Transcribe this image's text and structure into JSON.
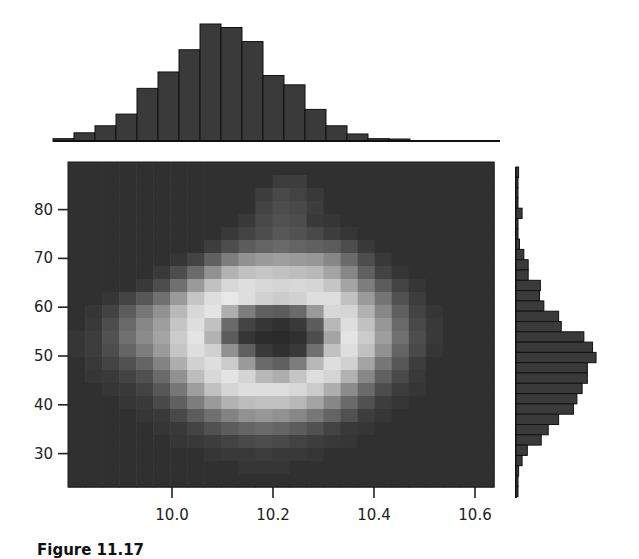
{
  "chart_data": {
    "type": "heatmap",
    "title": "",
    "caption": "Figure 11.17",
    "colormap": "grayscale (dark = low, light = high)",
    "colors": {
      "background": "#ffffff",
      "bar_fill": "#3a3a3a",
      "bar_edge": "#111111",
      "axis": "#222222"
    },
    "main": {
      "type": "heatmap",
      "xlabel": "",
      "ylabel": "",
      "xlim": [
        9.79,
        10.64
      ],
      "ylim": [
        23.5,
        90
      ],
      "xticks": [
        10.0,
        10.2,
        10.4,
        10.6
      ],
      "xtick_labels": [
        "10.0",
        "10.2",
        "10.4",
        "10.6"
      ],
      "yticks": [
        30,
        40,
        50,
        60,
        70,
        80
      ],
      "ytick_labels": [
        "30",
        "40",
        "50",
        "60",
        "70",
        "80"
      ],
      "grid": false,
      "rows": 25,
      "cols": 25,
      "description": "2D density showing a ring (annulus) of high density centered near x=10.2, y=51 with a dark low-density hole in the middle",
      "values_top_to_bottom": [
        [
          0.05,
          0.05,
          0.05,
          0.05,
          0.05,
          0.05,
          0.05,
          0.05,
          0.05,
          0.05,
          0.05,
          0.05,
          0.05,
          0.05,
          0.05,
          0.05,
          0.05,
          0.05,
          0.05,
          0.05,
          0.05,
          0.05,
          0.05,
          0.05,
          0.05
        ],
        [
          0.05,
          0.05,
          0.05,
          0.05,
          0.05,
          0.05,
          0.05,
          0.05,
          0.05,
          0.05,
          0.05,
          0.05,
          0.12,
          0.12,
          0.05,
          0.05,
          0.05,
          0.05,
          0.05,
          0.05,
          0.05,
          0.05,
          0.05,
          0.05,
          0.05
        ],
        [
          0.05,
          0.05,
          0.05,
          0.05,
          0.05,
          0.05,
          0.05,
          0.05,
          0.05,
          0.05,
          0.05,
          0.12,
          0.18,
          0.15,
          0.1,
          0.05,
          0.05,
          0.05,
          0.05,
          0.05,
          0.05,
          0.05,
          0.05,
          0.05,
          0.05
        ],
        [
          0.05,
          0.05,
          0.05,
          0.05,
          0.05,
          0.05,
          0.05,
          0.05,
          0.05,
          0.05,
          0.05,
          0.15,
          0.2,
          0.18,
          0.12,
          0.05,
          0.05,
          0.05,
          0.05,
          0.05,
          0.05,
          0.05,
          0.05,
          0.05,
          0.05
        ],
        [
          0.05,
          0.05,
          0.05,
          0.05,
          0.05,
          0.05,
          0.05,
          0.05,
          0.05,
          0.05,
          0.1,
          0.18,
          0.22,
          0.2,
          0.1,
          0.08,
          0.05,
          0.05,
          0.05,
          0.05,
          0.05,
          0.05,
          0.05,
          0.05,
          0.05
        ],
        [
          0.05,
          0.05,
          0.05,
          0.05,
          0.05,
          0.05,
          0.05,
          0.05,
          0.05,
          0.1,
          0.15,
          0.2,
          0.25,
          0.22,
          0.18,
          0.12,
          0.08,
          0.05,
          0.05,
          0.05,
          0.05,
          0.05,
          0.05,
          0.05,
          0.05
        ],
        [
          0.05,
          0.05,
          0.05,
          0.05,
          0.05,
          0.05,
          0.05,
          0.05,
          0.12,
          0.2,
          0.28,
          0.32,
          0.35,
          0.32,
          0.3,
          0.28,
          0.2,
          0.1,
          0.05,
          0.05,
          0.05,
          0.05,
          0.05,
          0.05,
          0.05
        ],
        [
          0.05,
          0.05,
          0.05,
          0.05,
          0.05,
          0.05,
          0.08,
          0.15,
          0.3,
          0.45,
          0.55,
          0.6,
          0.62,
          0.6,
          0.58,
          0.5,
          0.35,
          0.2,
          0.1,
          0.05,
          0.05,
          0.05,
          0.05,
          0.05,
          0.05
        ],
        [
          0.05,
          0.05,
          0.05,
          0.05,
          0.05,
          0.1,
          0.2,
          0.35,
          0.55,
          0.72,
          0.8,
          0.82,
          0.8,
          0.78,
          0.75,
          0.65,
          0.5,
          0.3,
          0.15,
          0.08,
          0.05,
          0.05,
          0.05,
          0.05,
          0.05
        ],
        [
          0.05,
          0.05,
          0.05,
          0.05,
          0.1,
          0.2,
          0.38,
          0.6,
          0.8,
          0.92,
          0.95,
          0.92,
          0.9,
          0.92,
          0.9,
          0.82,
          0.65,
          0.45,
          0.28,
          0.15,
          0.08,
          0.05,
          0.05,
          0.05,
          0.05
        ],
        [
          0.05,
          0.05,
          0.08,
          0.15,
          0.25,
          0.38,
          0.6,
          0.82,
          0.95,
          1.0,
          0.95,
          0.88,
          0.85,
          0.88,
          0.95,
          0.95,
          0.8,
          0.6,
          0.4,
          0.22,
          0.12,
          0.05,
          0.05,
          0.05,
          0.05
        ],
        [
          0.05,
          0.08,
          0.15,
          0.28,
          0.42,
          0.55,
          0.75,
          0.92,
          0.98,
          0.7,
          0.45,
          0.3,
          0.28,
          0.35,
          0.6,
          0.92,
          0.9,
          0.72,
          0.5,
          0.3,
          0.15,
          0.08,
          0.05,
          0.05,
          0.05
        ],
        [
          0.05,
          0.1,
          0.2,
          0.35,
          0.5,
          0.62,
          0.82,
          0.95,
          0.8,
          0.35,
          0.15,
          0.08,
          0.05,
          0.1,
          0.28,
          0.75,
          0.95,
          0.8,
          0.58,
          0.35,
          0.18,
          0.1,
          0.05,
          0.05,
          0.05
        ],
        [
          0.08,
          0.12,
          0.22,
          0.38,
          0.52,
          0.65,
          0.85,
          0.98,
          0.72,
          0.28,
          0.08,
          0.03,
          0.02,
          0.05,
          0.2,
          0.65,
          0.98,
          0.85,
          0.62,
          0.38,
          0.2,
          0.1,
          0.05,
          0.05,
          0.05
        ],
        [
          0.08,
          0.12,
          0.2,
          0.32,
          0.45,
          0.6,
          0.82,
          0.95,
          0.88,
          0.55,
          0.3,
          0.1,
          0.05,
          0.1,
          0.38,
          0.8,
          0.95,
          0.8,
          0.55,
          0.32,
          0.18,
          0.08,
          0.05,
          0.05,
          0.05
        ],
        [
          0.05,
          0.1,
          0.15,
          0.22,
          0.32,
          0.48,
          0.7,
          0.88,
          0.95,
          0.85,
          0.6,
          0.35,
          0.3,
          0.45,
          0.75,
          0.95,
          0.88,
          0.65,
          0.42,
          0.25,
          0.12,
          0.05,
          0.05,
          0.05,
          0.05
        ],
        [
          0.05,
          0.08,
          0.1,
          0.15,
          0.22,
          0.35,
          0.55,
          0.78,
          0.92,
          0.98,
          0.9,
          0.75,
          0.7,
          0.82,
          0.95,
          0.9,
          0.72,
          0.5,
          0.3,
          0.18,
          0.1,
          0.05,
          0.05,
          0.05,
          0.05
        ],
        [
          0.05,
          0.05,
          0.08,
          0.1,
          0.15,
          0.25,
          0.42,
          0.62,
          0.8,
          0.9,
          0.95,
          0.95,
          0.95,
          0.92,
          0.85,
          0.7,
          0.52,
          0.35,
          0.2,
          0.12,
          0.08,
          0.05,
          0.05,
          0.05,
          0.05
        ],
        [
          0.05,
          0.05,
          0.05,
          0.08,
          0.1,
          0.18,
          0.3,
          0.45,
          0.6,
          0.72,
          0.78,
          0.8,
          0.8,
          0.75,
          0.65,
          0.5,
          0.35,
          0.22,
          0.12,
          0.08,
          0.05,
          0.05,
          0.05,
          0.05,
          0.05
        ],
        [
          0.05,
          0.05,
          0.05,
          0.05,
          0.08,
          0.1,
          0.18,
          0.28,
          0.38,
          0.48,
          0.55,
          0.58,
          0.55,
          0.5,
          0.42,
          0.32,
          0.22,
          0.12,
          0.08,
          0.05,
          0.05,
          0.05,
          0.05,
          0.05,
          0.05
        ],
        [
          0.05,
          0.05,
          0.05,
          0.05,
          0.05,
          0.08,
          0.1,
          0.15,
          0.22,
          0.28,
          0.32,
          0.35,
          0.32,
          0.28,
          0.22,
          0.15,
          0.1,
          0.08,
          0.05,
          0.05,
          0.05,
          0.05,
          0.05,
          0.05,
          0.05
        ],
        [
          0.05,
          0.05,
          0.05,
          0.05,
          0.05,
          0.05,
          0.08,
          0.1,
          0.12,
          0.15,
          0.18,
          0.2,
          0.18,
          0.15,
          0.12,
          0.1,
          0.08,
          0.05,
          0.05,
          0.05,
          0.05,
          0.05,
          0.05,
          0.05,
          0.05
        ],
        [
          0.05,
          0.05,
          0.05,
          0.05,
          0.05,
          0.05,
          0.05,
          0.05,
          0.08,
          0.1,
          0.1,
          0.12,
          0.1,
          0.1,
          0.08,
          0.05,
          0.05,
          0.05,
          0.05,
          0.05,
          0.05,
          0.05,
          0.05,
          0.05,
          0.05
        ],
        [
          0.05,
          0.05,
          0.05,
          0.05,
          0.05,
          0.05,
          0.05,
          0.05,
          0.05,
          0.05,
          0.08,
          0.08,
          0.08,
          0.05,
          0.05,
          0.05,
          0.05,
          0.05,
          0.05,
          0.05,
          0.05,
          0.05,
          0.05,
          0.05,
          0.05
        ],
        [
          0.05,
          0.05,
          0.05,
          0.05,
          0.05,
          0.05,
          0.05,
          0.05,
          0.05,
          0.05,
          0.05,
          0.05,
          0.05,
          0.05,
          0.05,
          0.05,
          0.05,
          0.05,
          0.05,
          0.05,
          0.05,
          0.05,
          0.05,
          0.05,
          0.05
        ]
      ]
    },
    "top_histogram": {
      "type": "bar",
      "orientation": "vertical",
      "description": "Marginal distribution of x",
      "bin_left_edges": [
        9.75,
        9.79,
        9.83,
        9.87,
        9.92,
        9.96,
        10.0,
        10.04,
        10.08,
        10.12,
        10.16,
        10.21,
        10.25,
        10.29,
        10.33,
        10.37,
        10.41
      ],
      "bin_width": 0.042,
      "relative_heights": [
        0.02,
        0.07,
        0.13,
        0.23,
        0.45,
        0.59,
        0.78,
        1.0,
        0.97,
        0.85,
        0.56,
        0.48,
        0.27,
        0.13,
        0.06,
        0.02,
        0.01
      ],
      "axis_visible": false
    },
    "right_histogram": {
      "type": "bar",
      "orientation": "horizontal",
      "description": "Marginal distribution of y",
      "bin_height_units": 2.0,
      "bins_top_to_bottom_y_centers": [
        86,
        84,
        82,
        80,
        78,
        76,
        74,
        72,
        70,
        68,
        66,
        64,
        62,
        60,
        58,
        56,
        54,
        52,
        50,
        48,
        46,
        44,
        42,
        40,
        38,
        36,
        34,
        32,
        30,
        28,
        26,
        24
      ],
      "relative_widths_top_to_bottom": [
        0.03,
        0.0,
        0.0,
        0.02,
        0.07,
        0.0,
        0.02,
        0.04,
        0.09,
        0.14,
        0.14,
        0.28,
        0.27,
        0.32,
        0.49,
        0.52,
        0.78,
        0.88,
        0.92,
        0.82,
        0.82,
        0.76,
        0.7,
        0.66,
        0.49,
        0.37,
        0.29,
        0.13,
        0.07,
        0.03,
        0.02,
        0.01
      ],
      "axis_visible": false
    }
  }
}
